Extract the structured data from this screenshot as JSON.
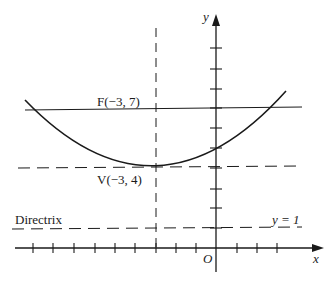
{
  "diagram": {
    "axes": {
      "x_label": "x",
      "y_label": "y",
      "origin_label": "O",
      "x_ticks": [
        -9,
        -8,
        -7,
        -6,
        -5,
        -4,
        -3,
        -2,
        -1,
        1,
        2,
        3
      ],
      "y_ticks": [
        1,
        2,
        3,
        4,
        5,
        6,
        7,
        8,
        9,
        10
      ]
    },
    "focus": {
      "label": "F(−3, 7)",
      "x": -3,
      "y": 7
    },
    "vertex": {
      "label": "V(−3, 4)",
      "x": -3,
      "y": 4
    },
    "directrix": {
      "label": "Directrix",
      "equation": "y = 1"
    },
    "axis_of_symmetry": {
      "x": -3
    },
    "curve": {
      "equation": "(x+3)^2 = 12(y-4)"
    },
    "caption": "Figure 3.12.2"
  }
}
